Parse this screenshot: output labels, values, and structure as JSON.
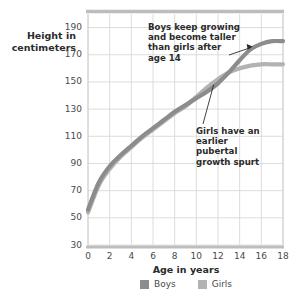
{
  "chart_data": {
    "type": "line",
    "title": "",
    "xlabel": "Age in years",
    "ylabel": "Height in centimeters",
    "xlim": [
      0,
      18
    ],
    "ylim": [
      30,
      200
    ],
    "xticks": [
      "0",
      "2",
      "4",
      "6",
      "8",
      "10",
      "12",
      "14",
      "16",
      "18"
    ],
    "yticks": [
      "190",
      "170",
      "150",
      "130",
      "110",
      "90",
      "70",
      "50",
      "30"
    ],
    "grid": true,
    "legend_position": "bottom-center",
    "x": [
      0,
      1,
      2,
      3,
      4,
      5,
      6,
      7,
      8,
      9,
      10,
      11,
      12,
      13,
      14,
      15,
      16,
      17,
      18
    ],
    "series": [
      {
        "name": "Boys",
        "color": "#8c8c8c",
        "values": [
          56,
          76,
          88,
          96,
          103,
          110,
          116,
          122,
          128,
          133,
          138,
          143,
          149,
          157,
          166,
          174,
          178,
          180,
          180
        ]
      },
      {
        "name": "Girls",
        "color": "#b2b2b2",
        "values": [
          54,
          74,
          86,
          95,
          102,
          109,
          115,
          121,
          127,
          132,
          139,
          146,
          152,
          157,
          160,
          162,
          163,
          163,
          163
        ]
      }
    ],
    "annotations": [
      {
        "id": "boys-note",
        "text": "Boys keep growing and become taller than girls after age 14",
        "points_to_x": 15.2,
        "points_to_y": 176
      },
      {
        "id": "girls-note",
        "text": "Girls have an earlier pubertal growth spurt",
        "points_to_x": 11.6,
        "points_to_y": 148
      }
    ]
  },
  "axis": {
    "y_title_line1": "Height in",
    "y_title_line2": "centimeters",
    "x_title": "Age in years"
  },
  "legend": {
    "items": [
      {
        "label": "Boys",
        "color": "#8c8c8c"
      },
      {
        "label": "Girls",
        "color": "#b2b2b2"
      }
    ]
  }
}
